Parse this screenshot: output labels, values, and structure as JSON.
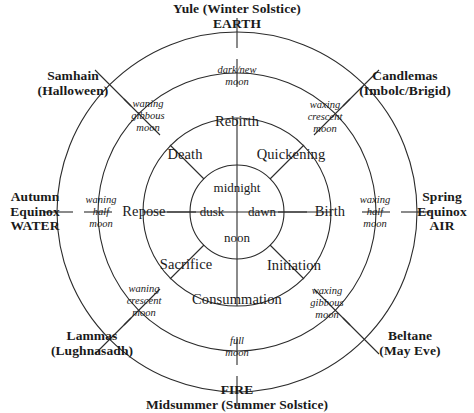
{
  "diagram": {
    "colors": {
      "ink": "#1a1a1a",
      "line": "#2b2b2b",
      "background": "#ffffff"
    },
    "rings": {
      "outer_radius": 180,
      "second_radius": 140,
      "third_radius": 95,
      "inner_radius": 48
    }
  },
  "festivals": [
    {
      "id": "yule",
      "name": "Yule (Winter Solstice)",
      "element": "EARTH",
      "position": "top"
    },
    {
      "id": "candlemas",
      "name": "Candlemas",
      "element": "(Imbolc/Brigid)",
      "position": "top-right"
    },
    {
      "id": "spring-equinox",
      "name": "Spring",
      "name2": "Equinox",
      "element": "AIR",
      "position": "right"
    },
    {
      "id": "beltane",
      "name": "Beltane",
      "element": "(May Eve)",
      "position": "bottom-right"
    },
    {
      "id": "midsummer",
      "name": "FIRE",
      "element": "Midsummer (Summer Solstice)",
      "position": "bottom"
    },
    {
      "id": "lammas",
      "name": "Lammas",
      "element": "(Lughnasadh)",
      "position": "bottom-left"
    },
    {
      "id": "autumn-equinox",
      "name": "Autumn",
      "name2": "Equinox",
      "element": "WATER",
      "position": "left"
    },
    {
      "id": "samhain",
      "name": "Samhain",
      "element": "(Halloween)",
      "position": "top-left"
    }
  ],
  "outer_labels": {
    "yule_line1": "Yule (Winter Solstice)",
    "yule_line2": "EARTH",
    "candlemas_line1": "Candlemas",
    "candlemas_line2": "(Imbolc/Brigid)",
    "spring_line1": "Spring",
    "spring_line2": "Equinox",
    "spring_line3": "AIR",
    "beltane_line1": "Beltane",
    "beltane_line2": "(May Eve)",
    "fire_line1": "FIRE",
    "fire_line2": "Midsummer (Summer Solstice)",
    "lammas_line1": "Lammas",
    "lammas_line2": "(Lughnasadh)",
    "autumn_line1": "Autumn",
    "autumn_line2": "Equinox",
    "autumn_line3": "WATER",
    "samhain_line1": "Samhain",
    "samhain_line2": "(Halloween)"
  },
  "moon_phases": [
    {
      "id": "dark-new-moon",
      "line1": "dark/new",
      "line2": "moon",
      "position": "top"
    },
    {
      "id": "waxing-crescent-moon",
      "line1": "waxing",
      "line2": "crescent",
      "line3": "moon",
      "position": "top-right"
    },
    {
      "id": "waxing-half-moon",
      "line1": "waxing",
      "line2": "half",
      "line3": "moon",
      "position": "right"
    },
    {
      "id": "waxing-gibbous-moon",
      "line1": "waxing",
      "line2": "gibbous",
      "line3": "moon",
      "position": "bottom-right"
    },
    {
      "id": "full-moon",
      "line1": "full",
      "line2": "moon",
      "position": "bottom"
    },
    {
      "id": "waning-crescent-moon",
      "line1": "waning",
      "line2": "crescent",
      "line3": "moon",
      "position": "bottom-left"
    },
    {
      "id": "waning-half-moon",
      "line1": "waning",
      "line2": "half",
      "line3": "moon",
      "position": "left"
    },
    {
      "id": "waning-gibbous-moon",
      "line1": "waning",
      "line2": "gibbous",
      "line3": "moon",
      "position": "top-left"
    }
  ],
  "moon_labels": {
    "dark_new_l1": "dark/new",
    "dark_new_l2": "moon",
    "waxing_crescent_l1": "waxing",
    "waxing_crescent_l2": "crescent",
    "waxing_crescent_l3": "moon",
    "waxing_half_l1": "waxing",
    "waxing_half_l2": "half",
    "waxing_half_l3": "moon",
    "waxing_gibbous_l1": "waxing",
    "waxing_gibbous_l2": "gibbous",
    "waxing_gibbous_l3": "moon",
    "full_l1": "full",
    "full_l2": "moon",
    "waning_crescent_l1": "waning",
    "waning_crescent_l2": "crescent",
    "waning_crescent_l3": "moon",
    "waning_half_l1": "waning",
    "waning_half_l2": "half",
    "waning_half_l3": "moon",
    "waning_gibbous_l1": "waning",
    "waning_gibbous_l2": "gibbous",
    "waning_gibbous_l3": "moon"
  },
  "life_stages": {
    "rebirth": "Rebirth",
    "quickening": "Quickening",
    "birth": "Birth",
    "initiation": "Initiation",
    "consummation": "Consummation",
    "sacrifice": "Sacrifice",
    "repose": "Repose",
    "death": "Death"
  },
  "times_of_day": {
    "midnight": "midnight",
    "dawn": "dawn",
    "noon": "noon",
    "dusk": "dusk"
  }
}
